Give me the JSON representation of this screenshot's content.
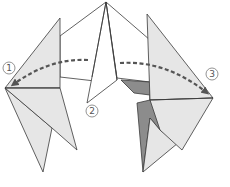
{
  "diagram": {
    "type": "origami-fold-diagram",
    "colors": {
      "background": "#ffffff",
      "paper_white": "#ffffff",
      "paper_light": "#e6e6e6",
      "paper_dark": "#8c8c8c",
      "outline": "#3a3a3a",
      "arrow": "#555555",
      "label_ring": "#777777"
    },
    "step_labels": [
      {
        "id": "1",
        "text": "1",
        "x": 9,
        "y": 68
      },
      {
        "id": "2",
        "text": "2",
        "x": 92,
        "y": 111
      },
      {
        "id": "3",
        "text": "3",
        "x": 212,
        "y": 74
      }
    ],
    "arrows": [
      {
        "name": "fold-arrow-left",
        "from_label": "center",
        "to_label": "1",
        "style": "dashed"
      },
      {
        "name": "fold-arrow-right",
        "from_label": "center",
        "to_label": "3",
        "style": "dashed"
      }
    ]
  }
}
